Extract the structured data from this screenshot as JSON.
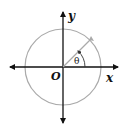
{
  "diagram": {
    "labels": {
      "x_axis": "x",
      "y_axis": "y",
      "origin": "O",
      "angle": "θ"
    },
    "geometry": {
      "origin": [
        63,
        67
      ],
      "radius": 38,
      "terminal_angle_deg": 48
    },
    "colors": {
      "axes": "#111111",
      "circle": "#aaaaaa",
      "terminal_ray": "#aaaaaa",
      "angle_arc": "#333333"
    }
  }
}
